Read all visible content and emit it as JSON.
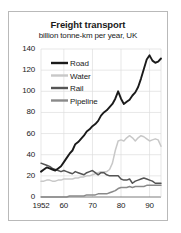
{
  "chart_data": {
    "type": "line",
    "title": "Freight transport",
    "subtitle": "billion tonne-km per year, UK",
    "xlabel": "",
    "ylabel": "",
    "xlim": [
      1952,
      1994
    ],
    "ylim": [
      0,
      140
    ],
    "grid": true,
    "legend_position": "top-left",
    "y_ticks": [
      0,
      20,
      40,
      60,
      80,
      100,
      120,
      140
    ],
    "y_tick_labels": [
      "0",
      "20",
      "40",
      "60",
      "80",
      "100",
      "120",
      "140"
    ],
    "x_ticks": [
      1952,
      1960,
      1970,
      1980,
      1990
    ],
    "x_tick_labels": [
      "1952",
      "60",
      "70",
      "80",
      "90"
    ],
    "colors": {
      "road": "#1a1a1a",
      "water": "#c8c8c8",
      "rail": "#555555",
      "pipeline": "#8a8a8a"
    },
    "series": [
      {
        "name": "Road",
        "color": "#1a1a1a",
        "x": [
          1952,
          1953,
          1954,
          1955,
          1956,
          1957,
          1958,
          1959,
          1960,
          1961,
          1962,
          1963,
          1964,
          1965,
          1966,
          1967,
          1968,
          1969,
          1970,
          1971,
          1972,
          1973,
          1974,
          1975,
          1976,
          1977,
          1978,
          1979,
          1980,
          1981,
          1982,
          1983,
          1984,
          1985,
          1986,
          1987,
          1988,
          1989,
          1990,
          1991,
          1992,
          1993,
          1994
        ],
        "values": [
          24,
          26,
          28,
          27,
          26,
          25,
          27,
          29,
          33,
          37,
          41,
          44,
          50,
          52,
          55,
          58,
          62,
          64,
          67,
          69,
          72,
          77,
          80,
          82,
          85,
          88,
          93,
          100,
          93,
          88,
          90,
          92,
          96,
          99,
          104,
          112,
          121,
          130,
          134,
          129,
          127,
          128,
          131
        ]
      },
      {
        "name": "Water",
        "color": "#c8c8c8",
        "x": [
          1952,
          1953,
          1954,
          1955,
          1956,
          1957,
          1958,
          1959,
          1960,
          1961,
          1962,
          1963,
          1964,
          1965,
          1966,
          1967,
          1968,
          1969,
          1970,
          1971,
          1972,
          1973,
          1974,
          1975,
          1976,
          1977,
          1978,
          1979,
          1980,
          1981,
          1982,
          1983,
          1984,
          1985,
          1986,
          1987,
          1988,
          1989,
          1990,
          1991,
          1992,
          1993,
          1994
        ],
        "values": [
          15,
          15,
          16,
          16,
          15,
          15,
          16,
          16,
          17,
          17,
          17,
          17,
          18,
          18,
          19,
          19,
          20,
          20,
          21,
          22,
          23,
          24,
          24,
          24,
          26,
          32,
          44,
          53,
          54,
          53,
          56,
          58,
          56,
          53,
          56,
          58,
          57,
          55,
          53,
          54,
          55,
          54,
          48
        ]
      },
      {
        "name": "Rail",
        "color": "#555555",
        "x": [
          1952,
          1953,
          1954,
          1955,
          1956,
          1957,
          1958,
          1959,
          1960,
          1961,
          1962,
          1963,
          1964,
          1965,
          1966,
          1967,
          1968,
          1969,
          1970,
          1971,
          1972,
          1973,
          1974,
          1975,
          1976,
          1977,
          1978,
          1979,
          1980,
          1981,
          1982,
          1983,
          1984,
          1985,
          1986,
          1987,
          1988,
          1989,
          1990,
          1991,
          1992,
          1993,
          1994
        ],
        "values": [
          32,
          31,
          30,
          29,
          27,
          26,
          25,
          24,
          25,
          24,
          23,
          22,
          24,
          23,
          22,
          21,
          23,
          24,
          25,
          23,
          21,
          23,
          23,
          21,
          20,
          20,
          20,
          20,
          17,
          16,
          16,
          17,
          13,
          15,
          16,
          17,
          18,
          17,
          16,
          15,
          13,
          13,
          13
        ]
      },
      {
        "name": "Pipeline",
        "color": "#8a8a8a",
        "x": [
          1952,
          1953,
          1954,
          1955,
          1956,
          1957,
          1958,
          1959,
          1960,
          1961,
          1962,
          1963,
          1964,
          1965,
          1966,
          1967,
          1968,
          1969,
          1970,
          1971,
          1972,
          1973,
          1974,
          1975,
          1976,
          1977,
          1978,
          1979,
          1980,
          1981,
          1982,
          1983,
          1984,
          1985,
          1986,
          1987,
          1988,
          1989,
          1990,
          1991,
          1992,
          1993,
          1994
        ],
        "values": [
          0,
          0,
          0,
          0,
          0,
          0,
          0,
          0,
          0,
          0,
          1,
          1,
          1,
          1,
          1,
          1,
          2,
          2,
          2,
          2,
          3,
          3,
          3,
          3,
          4,
          5,
          6,
          8,
          9,
          9,
          9,
          10,
          9,
          10,
          10,
          10,
          10,
          11,
          11,
          11,
          11,
          11,
          11
        ]
      }
    ]
  },
  "legend": {
    "items": [
      {
        "label": "Road"
      },
      {
        "label": "Water"
      },
      {
        "label": "Rail"
      },
      {
        "label": "Pipeline"
      }
    ]
  }
}
